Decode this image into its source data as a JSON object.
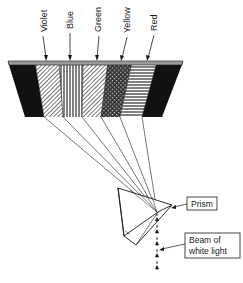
{
  "diagram": {
    "spectrum_labels": [
      {
        "label": "Violet",
        "pattern": "diagonal-hatch"
      },
      {
        "label": "Blue",
        "pattern": "vertical-lines"
      },
      {
        "label": "Green",
        "pattern": "diagonal-hatch"
      },
      {
        "label": "Yellow",
        "pattern": "cross-hatch"
      },
      {
        "label": "Red",
        "pattern": "horizontal-lines"
      }
    ],
    "callouts": {
      "prism": "Prism",
      "beam_line1": "Beam of",
      "beam_line2": "white light"
    },
    "colors": {
      "ink": "#1a1a1a",
      "screen_dark": "#111111",
      "screen_edge": "#9a9a9a",
      "background": "#ffffff"
    }
  }
}
